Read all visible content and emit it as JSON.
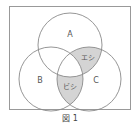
{
  "diagram": {
    "type": "venn",
    "sets": [
      {
        "id": "A",
        "label": "A"
      },
      {
        "id": "B",
        "label": "B"
      },
      {
        "id": "C",
        "label": "C"
      }
    ],
    "regions": [
      {
        "sets": [
          "A",
          "C"
        ],
        "excluding": [
          "B"
        ],
        "label": "エシ",
        "shaded": true
      },
      {
        "sets": [
          "B",
          "C"
        ],
        "excluding": [
          "A"
        ],
        "label": "ビシ",
        "shaded": true
      }
    ],
    "caption": "図 1",
    "colors": {
      "stroke": "#8a8a8a",
      "frame": "#999999",
      "shade": "#d4d4d4",
      "text": "#555555"
    }
  }
}
